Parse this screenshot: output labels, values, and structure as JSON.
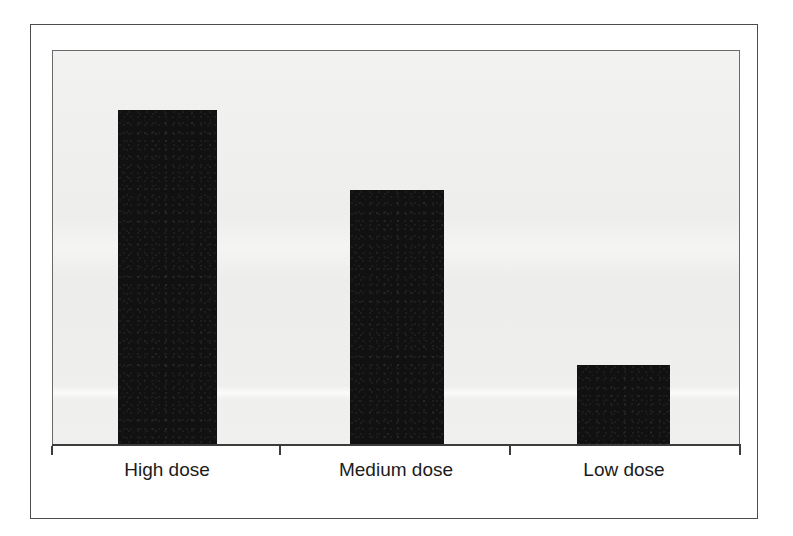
{
  "figure": {
    "background_color": "#ffffff",
    "outer_frame_color": "#4c4c4c",
    "panel_frame_color": "#6a6a6a",
    "panel_fill_color": "#f0f0ee",
    "axis_color": "#3c3c3c",
    "bar_color": "#111111",
    "label_color": "#1b1b1b"
  },
  "chart_data": {
    "type": "bar",
    "title": "",
    "subtitle": "",
    "xlabel": "",
    "ylabel": "",
    "categories": [
      "High dose",
      "Medium dose",
      "Low dose"
    ],
    "values": [
      100,
      76,
      24
    ],
    "series": [
      {
        "name": "Response",
        "values": [
          100,
          76,
          24
        ]
      }
    ],
    "ylim": [
      0,
      118
    ],
    "xlim": [
      0,
      3
    ],
    "grid": false,
    "legend": false,
    "legend_position": "none",
    "axis_tick_labels_y": [],
    "value_labels_shown": false,
    "orientation": "vertical",
    "bar_color": "#111111"
  },
  "bars": [
    {
      "category": "High dose",
      "value": 100,
      "left_px": 118,
      "width_px": 99,
      "top_px": 110,
      "height_px": 334
    },
    {
      "category": "Medium dose",
      "value": 76,
      "left_px": 350,
      "width_px": 94,
      "top_px": 190,
      "height_px": 254
    },
    {
      "category": "Low dose",
      "value": 24,
      "left_px": 577,
      "width_px": 93,
      "top_px": 365,
      "height_px": 79
    }
  ],
  "axis": {
    "baseline_y_px": 444,
    "ticks_x_px": [
      52,
      280,
      510,
      740
    ]
  },
  "labels": [
    {
      "text": "High dose",
      "center_x_px": 167
    },
    {
      "text": "Medium dose",
      "center_x_px": 396
    },
    {
      "text": "Low dose",
      "center_x_px": 624
    }
  ]
}
